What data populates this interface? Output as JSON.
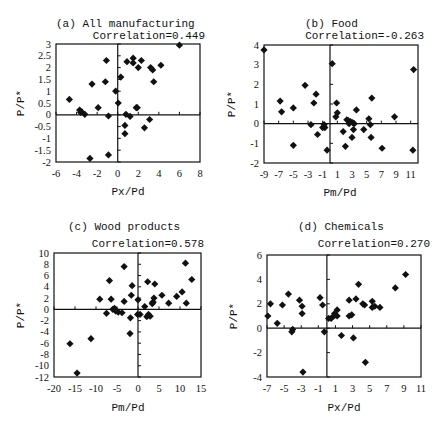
{
  "figure": {
    "background": "#ffffff",
    "marker_color": "#111111",
    "axis_color": "#111111"
  },
  "chart_data": [
    {
      "id": "a",
      "type": "scatter",
      "title": "(a) All manufacturing",
      "annotation": "Correlation=0.449",
      "xlabel": "Px/Pd",
      "ylabel": "P/P*",
      "xlim": [
        -6,
        8
      ],
      "ylim": [
        -2,
        3
      ],
      "xticks": [
        -6,
        -4,
        -2,
        0,
        2,
        4,
        6,
        8
      ],
      "yticks": [
        -2,
        -1.5,
        -1,
        -0.5,
        0,
        0.5,
        1,
        1.5,
        2,
        2.5,
        3
      ],
      "ytick_labels": [
        "-2",
        "-1.5",
        "-1",
        "-0.5",
        "0",
        "0.5",
        "1",
        "1.5",
        "2",
        "2.5",
        "3"
      ],
      "grid": false,
      "box": {
        "left": 56,
        "right": 200,
        "top": 44,
        "bottom": 162
      },
      "points": [
        [
          -4.7,
          0.65
        ],
        [
          -3.7,
          0.2
        ],
        [
          -3.6,
          0.1
        ],
        [
          -3.5,
          0.12
        ],
        [
          -3.2,
          0.02
        ],
        [
          -2.5,
          1.3
        ],
        [
          -1.9,
          0.3
        ],
        [
          -1.2,
          1.4
        ],
        [
          -1.1,
          2.3
        ],
        [
          -0.9,
          -0.05
        ],
        [
          -0.2,
          1.0
        ],
        [
          0.05,
          0.5
        ],
        [
          0.3,
          1.6
        ],
        [
          -0.9,
          -1.7
        ],
        [
          -2.7,
          -1.85
        ],
        [
          0.7,
          -0.45
        ],
        [
          0.7,
          -0.8
        ],
        [
          0.8,
          0.02
        ],
        [
          1.2,
          -0.07
        ],
        [
          0.9,
          2.25
        ],
        [
          1.5,
          2.4
        ],
        [
          1.5,
          2.2
        ],
        [
          1.8,
          0.3
        ],
        [
          2.0,
          2.0
        ],
        [
          2.3,
          2.3
        ],
        [
          2.6,
          -0.55
        ],
        [
          3.1,
          -0.2
        ],
        [
          3.2,
          2.0
        ],
        [
          3.4,
          1.9
        ],
        [
          3.5,
          1.4
        ],
        [
          4.2,
          2.1
        ],
        [
          6.0,
          2.95
        ],
        [
          1.9,
          0.3
        ]
      ]
    },
    {
      "id": "b",
      "type": "scatter",
      "title": "(b) Food",
      "annotation": "Correlation=-0.263",
      "xlabel": "Pm/Pd",
      "ylabel": "P/P*",
      "xlim": [
        -9,
        12
      ],
      "ylim": [
        -2,
        4
      ],
      "xticks": [
        -9,
        -7,
        -5,
        -3,
        -1,
        1,
        3,
        5,
        7,
        9,
        11
      ],
      "yticks": [
        -2,
        -1,
        0,
        1,
        2,
        3,
        4
      ],
      "ytick_labels": [
        "-2",
        "-1",
        "0",
        "1",
        "2",
        "3",
        "4"
      ],
      "grid": false,
      "box": {
        "left": 264,
        "right": 418,
        "top": 45,
        "bottom": 163
      },
      "points": [
        [
          -9.0,
          3.75
        ],
        [
          -6.8,
          1.15
        ],
        [
          -6.6,
          0.6
        ],
        [
          -5.0,
          0.8
        ],
        [
          -5.0,
          -1.1
        ],
        [
          -3.4,
          1.95
        ],
        [
          -2.6,
          -0.05
        ],
        [
          -2.2,
          1.05
        ],
        [
          -1.9,
          1.5
        ],
        [
          -1.7,
          -0.55
        ],
        [
          -1.0,
          -0.2
        ],
        [
          -0.8,
          -0.05
        ],
        [
          -0.7,
          -0.2
        ],
        [
          -0.4,
          -1.35
        ],
        [
          0.3,
          3.05
        ],
        [
          0.8,
          0.35
        ],
        [
          0.9,
          1.05
        ],
        [
          1.0,
          0.55
        ],
        [
          1.8,
          -0.4
        ],
        [
          2.1,
          -1.15
        ],
        [
          2.3,
          0.2
        ],
        [
          2.5,
          0.15
        ],
        [
          2.8,
          0.1
        ],
        [
          3.0,
          -0.7
        ],
        [
          3.1,
          0.05
        ],
        [
          3.2,
          -0.3
        ],
        [
          3.6,
          0.7
        ],
        [
          4.6,
          -0.3
        ],
        [
          5.3,
          0.25
        ],
        [
          5.5,
          -0.05
        ],
        [
          5.6,
          -0.7
        ],
        [
          5.7,
          1.3
        ],
        [
          7.1,
          -1.25
        ],
        [
          8.8,
          0.35
        ],
        [
          11.3,
          -1.35
        ],
        [
          11.4,
          2.75
        ],
        [
          3.3,
          0.0
        ],
        [
          2.6,
          0.0
        ]
      ]
    },
    {
      "id": "c",
      "type": "scatter",
      "title": "(c) Wood products",
      "annotation": "Correlation=0.578",
      "xlabel": "Pm/Pd",
      "ylabel": "P/P*",
      "xlim": [
        -20,
        15
      ],
      "ylim": [
        -12,
        10
      ],
      "xticks": [
        -20,
        -15,
        -10,
        -5,
        0,
        5,
        10,
        15
      ],
      "yticks": [
        -12,
        -10,
        -8,
        -6,
        -4,
        -2,
        0,
        2,
        4,
        6,
        8,
        10
      ],
      "ytick_labels": [
        "-12",
        "-10",
        "-8",
        "-6",
        "-4",
        "-2",
        "0",
        "2",
        "4",
        "6",
        "8",
        "10"
      ],
      "grid": false,
      "box": {
        "left": 54,
        "right": 201,
        "top": 253,
        "bottom": 377
      },
      "points": [
        [
          -16.2,
          -6.1
        ],
        [
          -14.5,
          -11.3
        ],
        [
          -11.2,
          -5.2
        ],
        [
          -9.1,
          1.8
        ],
        [
          -7.5,
          -0.7
        ],
        [
          -6.8,
          5.1
        ],
        [
          -6.4,
          1.8
        ],
        [
          -6.0,
          0.0
        ],
        [
          -5.6,
          0.2
        ],
        [
          -5.3,
          -0.3
        ],
        [
          -4.7,
          -0.5
        ],
        [
          -3.8,
          -0.6
        ],
        [
          -3.3,
          1.4
        ],
        [
          -3.3,
          7.6
        ],
        [
          -1.8,
          -1.5
        ],
        [
          -1.9,
          -4.3
        ],
        [
          -1.6,
          2.5
        ],
        [
          -1.4,
          4.2
        ],
        [
          0.0,
          1.7
        ],
        [
          0.5,
          -0.9
        ],
        [
          1.6,
          0.5
        ],
        [
          2.1,
          -1.3
        ],
        [
          2.3,
          4.9
        ],
        [
          2.5,
          -0.9
        ],
        [
          2.9,
          -1.2
        ],
        [
          3.4,
          1.0
        ],
        [
          3.6,
          1.3
        ],
        [
          3.8,
          2.0
        ],
        [
          4.0,
          4.5
        ],
        [
          5.7,
          2.5
        ],
        [
          7.3,
          1.1
        ],
        [
          9.2,
          2.3
        ],
        [
          10.5,
          3.1
        ],
        [
          11.3,
          8.2
        ],
        [
          11.5,
          1.1
        ],
        [
          12.8,
          5.3
        ],
        [
          3.5,
          1.2
        ],
        [
          -0.1,
          -0.9
        ]
      ]
    },
    {
      "id": "d",
      "type": "scatter",
      "title": "(d) Chemicals",
      "annotation": "Correlation=0.270",
      "xlabel": "Px/Pd",
      "ylabel": "P/P*",
      "xlim": [
        -7,
        11
      ],
      "ylim": [
        -4,
        6
      ],
      "xticks": [
        -7,
        -5,
        -3,
        -1,
        1,
        3,
        5,
        7,
        9,
        11
      ],
      "yticks": [
        -4,
        -2,
        0,
        2,
        4,
        6
      ],
      "ytick_labels": [
        "-4",
        "-2",
        "0",
        "2",
        "4",
        "6"
      ],
      "grid": false,
      "box": {
        "left": 267,
        "right": 421,
        "top": 255,
        "bottom": 377
      },
      "points": [
        [
          -6.9,
          1.0
        ],
        [
          -6.6,
          2.0
        ],
        [
          -5.8,
          0.4
        ],
        [
          -5.2,
          1.9
        ],
        [
          -4.5,
          2.8
        ],
        [
          -4.1,
          -0.3
        ],
        [
          -4.0,
          -0.1
        ],
        [
          -3.2,
          2.3
        ],
        [
          -2.9,
          1.8
        ],
        [
          -2.9,
          1.2
        ],
        [
          -2.8,
          -3.6
        ],
        [
          -0.8,
          2.5
        ],
        [
          -0.5,
          1.9
        ],
        [
          -0.3,
          -0.3
        ],
        [
          0.2,
          0.8
        ],
        [
          0.5,
          0.8
        ],
        [
          0.8,
          1.0
        ],
        [
          0.9,
          1.2
        ],
        [
          1.2,
          1.0
        ],
        [
          1.2,
          1.5
        ],
        [
          1.7,
          -0.6
        ],
        [
          2.6,
          2.3
        ],
        [
          2.6,
          1.0
        ],
        [
          2.9,
          1.1
        ],
        [
          3.1,
          -0.8
        ],
        [
          3.4,
          2.4
        ],
        [
          3.7,
          3.6
        ],
        [
          4.2,
          2.0
        ],
        [
          4.4,
          1.9
        ],
        [
          4.5,
          -2.8
        ],
        [
          5.3,
          2.2
        ],
        [
          5.3,
          1.7
        ],
        [
          5.6,
          1.8
        ],
        [
          6.2,
          1.7
        ],
        [
          8.0,
          3.3
        ],
        [
          9.2,
          4.4
        ],
        [
          1.0,
          1.1
        ]
      ]
    }
  ]
}
